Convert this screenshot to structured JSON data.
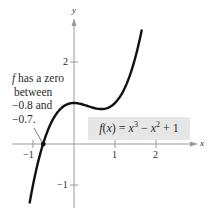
{
  "chart_data": {
    "type": "line",
    "title": "",
    "xlabel": "x",
    "ylabel": "y",
    "function": "f(x) = x^3 - x^2 + 1",
    "series": [
      {
        "name": "f(x) = x^3 - x^2 + 1",
        "x": [
          -1.08,
          -1.0,
          -0.9,
          -0.8,
          -0.7,
          -0.6,
          -0.4,
          -0.2,
          0.0,
          0.2,
          0.4,
          0.6,
          0.667,
          0.8,
          1.0,
          1.2,
          1.4,
          1.6,
          1.65
        ],
        "y": [
          -1.43,
          -1.0,
          -0.54,
          -0.15,
          0.17,
          0.42,
          0.78,
          0.95,
          1.0,
          0.97,
          0.9,
          0.86,
          0.85,
          0.87,
          1.0,
          1.29,
          1.78,
          2.54,
          2.77
        ]
      }
    ],
    "xticks": [
      -1,
      1,
      2
    ],
    "yticks": [
      2,
      -1
    ],
    "xlim": [
      -1.2,
      2.3
    ],
    "ylim": [
      -1.5,
      3.0
    ],
    "grid": false,
    "annotations": [
      {
        "text": "f has a zero between −0.8 and −0.7.",
        "points_to": [
          -0.75,
          0
        ]
      },
      {
        "text": "f(x) = x³ − x² + 1",
        "boxed": true
      }
    ]
  },
  "labels": {
    "y_axis": "y",
    "x_axis": "x",
    "xtick_neg1": "−1",
    "xtick_1": "1",
    "xtick_2": "2",
    "ytick_2": "2",
    "ytick_neg1": "−1",
    "ann_f": "f",
    "ann_line1": " has a zero",
    "ann_line2": "between",
    "ann_line3": "−0.8 and",
    "ann_line4": "−0.7.",
    "formula_f": "f",
    "formula_paren": "(",
    "formula_x": "x",
    "formula_mid": ") = ",
    "formula_x3": "x",
    "formula_exp3": "3",
    "formula_minus": " − ",
    "formula_x2": "x",
    "formula_exp2": "2",
    "formula_tail": " + 1"
  }
}
